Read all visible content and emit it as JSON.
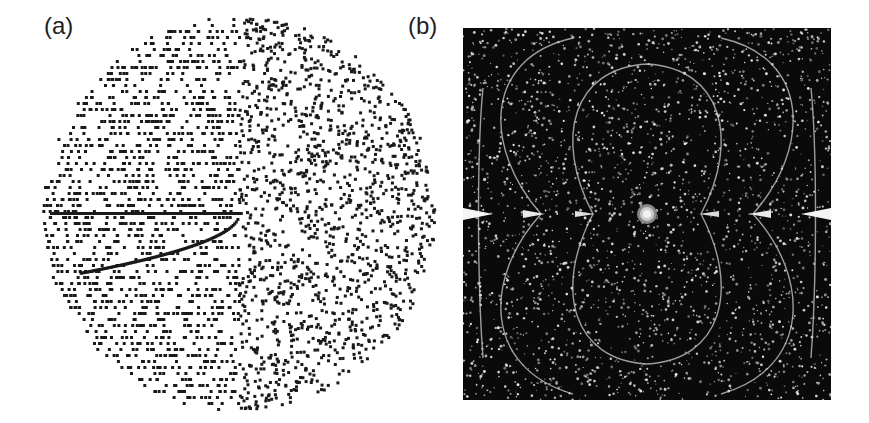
{
  "figure": {
    "panels": [
      {
        "label": "(a)",
        "description": "Black dot pattern filling a circular disc on white background, with horizontal streaks on the left half and a bright arc curving downward from the center"
      },
      {
        "label": "(b)",
        "description": "Dark square field with scattered white speckles, dipole-like curved field lines arcing above and below, bright cusps along the horizontal midline and a bright circular source at the center"
      }
    ],
    "colors": {
      "background": "#ffffff",
      "dot": "#1a1a1a",
      "panel_b_bg": "#0a0a0a",
      "speckle": "#e6e6e6"
    }
  }
}
